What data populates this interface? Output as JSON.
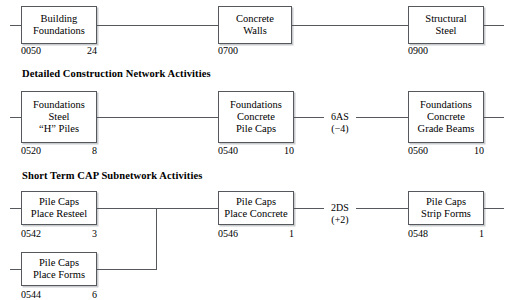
{
  "diagram": {
    "type": "precedence-network-diagram",
    "sections": [
      {
        "id": "top",
        "header": "",
        "nodes": [
          {
            "lines": [
              "Building",
              "Foundations"
            ],
            "id": "0050",
            "duration": "24"
          },
          {
            "lines": [
              "Concrete",
              "Walls"
            ],
            "id": "0700",
            "duration": ""
          },
          {
            "lines": [
              "Structural",
              "Steel"
            ],
            "id": "0900",
            "duration": ""
          }
        ],
        "links": []
      },
      {
        "id": "middle",
        "header": "Detailed Construction Network Activities",
        "nodes": [
          {
            "lines": [
              "Foundations",
              "Steel",
              "“H” Piles"
            ],
            "id": "0520",
            "duration": "8"
          },
          {
            "lines": [
              "Foundations",
              "Concrete",
              "Pile Caps"
            ],
            "id": "0540",
            "duration": "10"
          },
          {
            "lines": [
              "Foundations",
              "Concrete",
              "Grade Beams"
            ],
            "id": "0560",
            "duration": "10"
          }
        ],
        "links": [
          {
            "code": "6AS",
            "value": "(−4)"
          }
        ]
      },
      {
        "id": "bottom",
        "header": "Short Term CAP Subnetwork Activities",
        "nodes": [
          {
            "lines": [
              "Pile Caps",
              "Place Resteel"
            ],
            "id": "0542",
            "duration": "3"
          },
          {
            "lines": [
              "Pile Caps",
              "Place Forms"
            ],
            "id": "0544",
            "duration": "6"
          },
          {
            "lines": [
              "Pile Caps",
              "Place Concrete"
            ],
            "id": "0546",
            "duration": "1"
          },
          {
            "lines": [
              "Pile Caps",
              "Strip Forms"
            ],
            "id": "0548",
            "duration": "1"
          }
        ],
        "links": [
          {
            "code": "2DS",
            "value": "(+2)"
          }
        ]
      }
    ],
    "colors": {
      "line": "#55585c",
      "shadow": "#c9cbcd",
      "text": "#000000",
      "background": "#ffffff"
    }
  }
}
